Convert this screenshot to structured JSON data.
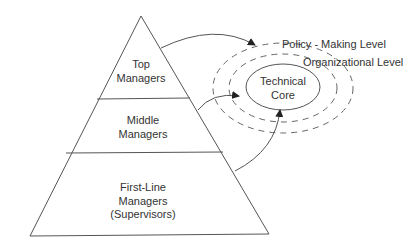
{
  "pyramid": {
    "levels": [
      {
        "lines": [
          "Top",
          "Managers"
        ]
      },
      {
        "lines": [
          "Middle",
          "Managers"
        ]
      },
      {
        "lines": [
          "First-Line",
          "Managers",
          "(Supervisors)"
        ]
      }
    ]
  },
  "environment": {
    "core": {
      "lines": [
        "Technical",
        "Core"
      ]
    },
    "outer_label": "Policy - Making Level",
    "inner_label": "Organizational Level"
  },
  "colors": {
    "stroke": "#555555",
    "text": "#333333",
    "background": "#ffffff"
  }
}
